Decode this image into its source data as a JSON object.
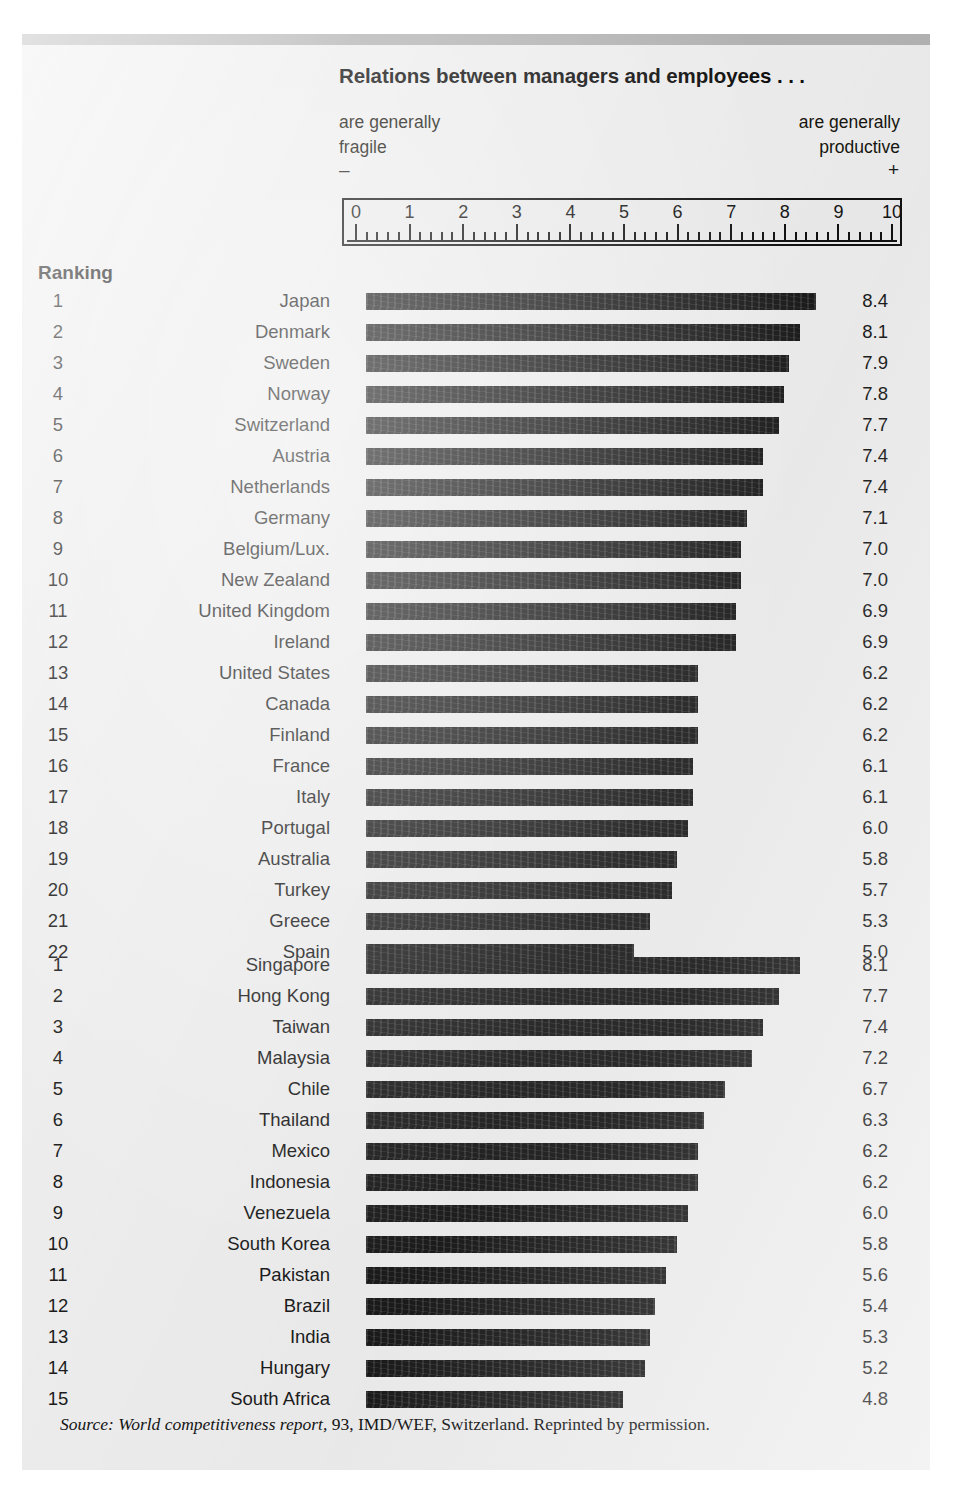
{
  "figure": {
    "title": "Relations between managers and employees . . .",
    "axis_caption_left_line1": "are generally",
    "axis_caption_left_line2": "fragile",
    "axis_caption_right_line1": "are generally",
    "axis_caption_right_line2": "productive",
    "sign_left": "–",
    "sign_right": "+",
    "ranking_header": "Ranking",
    "source_prefix": "Source:",
    "source_italic": "World competitiveness report,",
    "source_rest": " 93, IMD/WEF, Switzerland. Reprinted by permission.",
    "bar_color": "#1b1b1b",
    "background_color": "#eeeeee",
    "rule_color": "#b4b4b4"
  },
  "chart_data": {
    "type": "bar",
    "orientation": "horizontal",
    "title": "Relations between managers and employees . . .",
    "xlabel": "",
    "ylabel": "Ranking",
    "xlim": [
      0,
      10
    ],
    "grid": false,
    "legend": null,
    "axis_tick_labels": [
      "0",
      "1",
      "2",
      "3",
      "4",
      "5",
      "6",
      "7",
      "8",
      "9",
      "10"
    ],
    "axis_annotation_left": "are generally fragile (–)",
    "axis_annotation_right": "are generally productive (+)",
    "groups": [
      {
        "name": "group-1",
        "categories": [
          "Japan",
          "Denmark",
          "Sweden",
          "Norway",
          "Switzerland",
          "Austria",
          "Netherlands",
          "Germany",
          "Belgium/Lux.",
          "New Zealand",
          "United Kingdom",
          "Ireland",
          "United States",
          "Canada",
          "Finland",
          "France",
          "Italy",
          "Portugal",
          "Australia",
          "Turkey",
          "Greece",
          "Spain"
        ],
        "ranks": [
          1,
          2,
          3,
          4,
          5,
          6,
          7,
          8,
          9,
          10,
          11,
          12,
          13,
          14,
          15,
          16,
          17,
          18,
          19,
          20,
          21,
          22
        ],
        "values": [
          8.4,
          8.1,
          7.9,
          7.8,
          7.7,
          7.4,
          7.4,
          7.1,
          7.0,
          7.0,
          6.9,
          6.9,
          6.2,
          6.2,
          6.2,
          6.1,
          6.1,
          6.0,
          5.8,
          5.7,
          5.3,
          5.0
        ],
        "value_labels": [
          "8.4",
          "8.1",
          "7.9",
          "7.8",
          "7.7",
          "7.4",
          "7.4",
          "7.1",
          "7.0",
          "7.0",
          "6.9",
          "6.9",
          "6.2",
          "6.2",
          "6.2",
          "6.1",
          "6.1",
          "6.0",
          "5.8",
          "5.7",
          "5.3",
          "5.0"
        ]
      },
      {
        "name": "group-2",
        "categories": [
          "Singapore",
          "Hong Kong",
          "Taiwan",
          "Malaysia",
          "Chile",
          "Thailand",
          "Mexico",
          "Indonesia",
          "Venezuela",
          "South Korea",
          "Pakistan",
          "Brazil",
          "India",
          "Hungary",
          "South Africa"
        ],
        "ranks": [
          1,
          2,
          3,
          4,
          5,
          6,
          7,
          8,
          9,
          10,
          11,
          12,
          13,
          14,
          15
        ],
        "values": [
          8.1,
          7.7,
          7.4,
          7.2,
          6.7,
          6.3,
          6.2,
          6.2,
          6.0,
          5.8,
          5.6,
          5.4,
          5.3,
          5.2,
          4.8
        ],
        "value_labels": [
          "8.1",
          "7.7",
          "7.4",
          "7.2",
          "6.7",
          "6.3",
          "6.2",
          "6.2",
          "6.0",
          "5.8",
          "5.6",
          "5.4",
          "5.3",
          "5.2",
          "4.8"
        ]
      }
    ]
  }
}
